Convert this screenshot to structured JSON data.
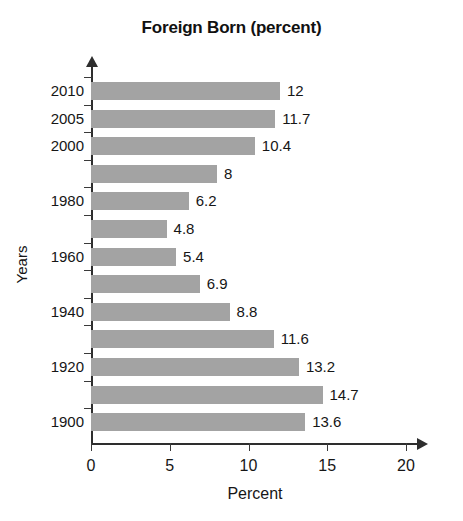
{
  "chart_data": {
    "type": "bar",
    "orientation": "horizontal",
    "title": "Foreign Born (percent)",
    "xlabel": "Percent",
    "ylabel": "Years",
    "xlim": [
      0,
      20
    ],
    "xticks": [
      "0",
      "5",
      "10",
      "15",
      "20"
    ],
    "grid": false,
    "legend": null,
    "bar_color": "#a3a3a3",
    "axis_color": "#2e2e2e",
    "categories": [
      "2010",
      "2005",
      "2000",
      "1990",
      "1980",
      "1970",
      "1960",
      "1950",
      "1940",
      "1930",
      "1920",
      "1910",
      "1900"
    ],
    "visible_category_labels": [
      "2010",
      "2005",
      "2000",
      "",
      "1980",
      "",
      "1960",
      "",
      "1940",
      "",
      "1920",
      "",
      "1900"
    ],
    "values": [
      12,
      11.7,
      10.4,
      8,
      6.2,
      4.8,
      5.4,
      6.9,
      8.8,
      11.6,
      13.2,
      14.7,
      13.6
    ],
    "value_labels": [
      "12",
      "11.7",
      "10.4",
      "8",
      "6.2",
      "4.8",
      "5.4",
      "6.9",
      "8.8",
      "11.6",
      "13.2",
      "14.7",
      "13.6"
    ]
  }
}
